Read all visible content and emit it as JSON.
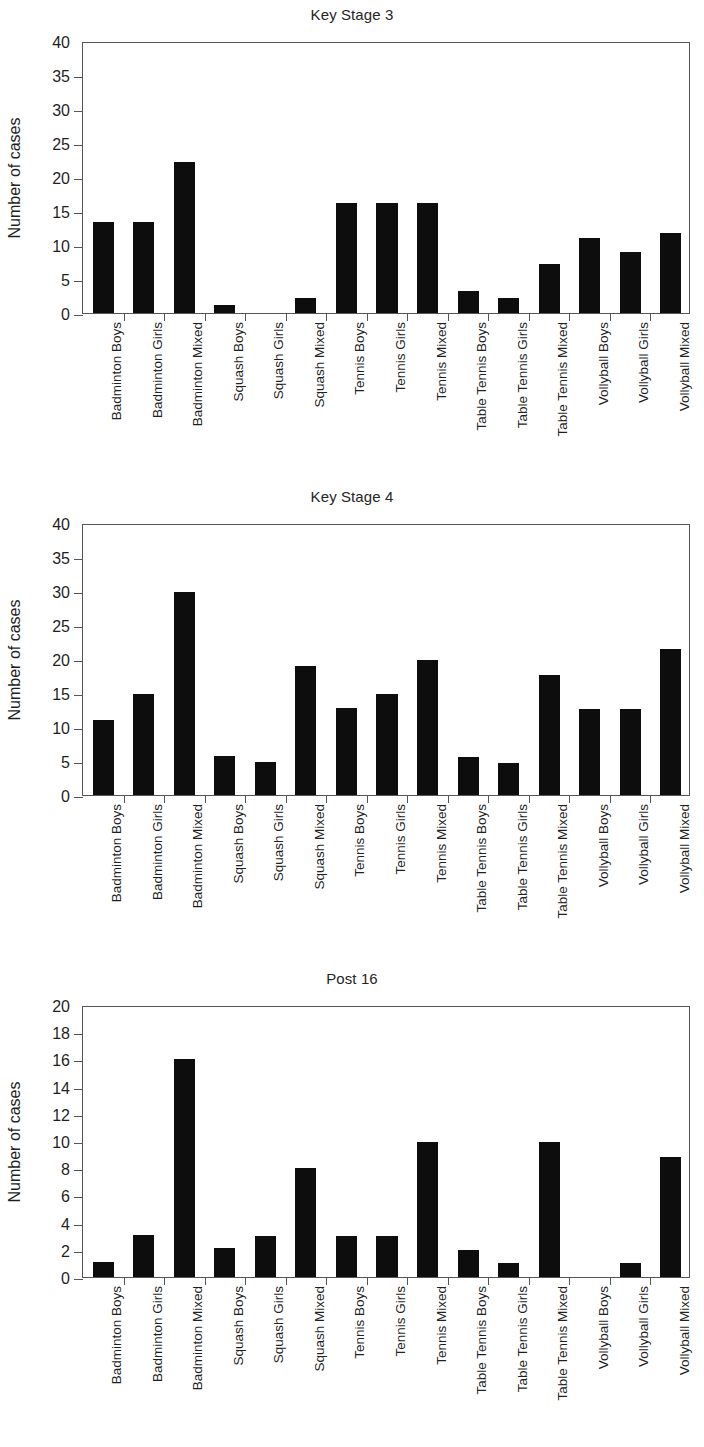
{
  "chart_data": [
    {
      "type": "bar",
      "title": "Key Stage 3",
      "xlabel": "",
      "ylabel": "Number of cases",
      "ylim": [
        0,
        40
      ],
      "ytick_step": 5,
      "yticks": [
        0,
        5,
        10,
        15,
        20,
        25,
        30,
        35,
        40
      ],
      "grid": false,
      "legend": "none",
      "bar_color": "#0d0d0d",
      "categories": [
        "Badminton Boys",
        "Badminton Girls",
        "Badminton Mixed",
        "Squash Boys",
        "Squash Girls",
        "Squash Mixed",
        "Tennis Boys",
        "Tennis Girls",
        "Tennis Mixed",
        "Table Tennis Boys",
        "Table Tennis Girls",
        "Table Tennis Mixed",
        "Vollyball Boys",
        "Vollyball Girls",
        "Vollyball Mixed"
      ],
      "values": [
        13.4,
        13.4,
        22.2,
        1.2,
        0,
        2.2,
        16.2,
        16.2,
        16.2,
        3.2,
        2.2,
        7.2,
        11.0,
        9.0,
        11.8
      ]
    },
    {
      "type": "bar",
      "title": "Key Stage 4",
      "xlabel": "",
      "ylabel": "Number of cases",
      "ylim": [
        0,
        40
      ],
      "ytick_step": 5,
      "yticks": [
        0,
        5,
        10,
        15,
        20,
        25,
        30,
        35,
        40
      ],
      "grid": false,
      "legend": "none",
      "bar_color": "#0d0d0d",
      "categories": [
        "Badminton Boys",
        "Badminton Girls",
        "Badminton Mixed",
        "Squash Boys",
        "Squash Girls",
        "Squash Mixed",
        "Tennis Boys",
        "Tennis Girls",
        "Tennis Mixed",
        "Table Tennis Boys",
        "Table Tennis Girls",
        "Table Tennis Mixed",
        "Vollyball Boys",
        "Vollyball Girls",
        "Vollyball Mixed"
      ],
      "values": [
        11.0,
        14.8,
        29.9,
        5.8,
        4.8,
        19.0,
        12.8,
        14.8,
        19.8,
        5.6,
        4.7,
        17.6,
        12.7,
        12.7,
        21.5
      ]
    },
    {
      "type": "bar",
      "title": "Post 16",
      "xlabel": "",
      "ylabel": "Number of cases",
      "ylim": [
        0,
        20
      ],
      "ytick_step": 2,
      "yticks": [
        0,
        2,
        4,
        6,
        8,
        10,
        12,
        14,
        16,
        18,
        20
      ],
      "grid": false,
      "legend": "none",
      "bar_color": "#0d0d0d",
      "categories": [
        "Badminton Boys",
        "Badminton Girls",
        "Badminton Mixed",
        "Squash Boys",
        "Squash Girls",
        "Squash Mixed",
        "Tennis Boys",
        "Tennis Girls",
        "Tennis Mixed",
        "Table Tennis Boys",
        "Table Tennis Girls",
        "Table Tennis Mixed",
        "Vollyball Boys",
        "Vollyball Girls",
        "Vollyball Mixed"
      ],
      "values": [
        1.1,
        3.1,
        16.0,
        2.1,
        3.0,
        8.0,
        3.0,
        3.0,
        9.9,
        2.0,
        1.0,
        9.9,
        0,
        1.0,
        8.8
      ]
    }
  ]
}
